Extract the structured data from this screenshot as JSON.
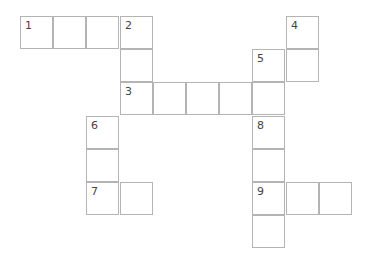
{
  "puzzle": {
    "type": "crossword",
    "origin": {
      "x": 20,
      "y": 16
    },
    "cell_size": 33.2,
    "cells": [
      {
        "row": 0,
        "col": 0,
        "number": "1"
      },
      {
        "row": 0,
        "col": 1,
        "number": ""
      },
      {
        "row": 0,
        "col": 2,
        "number": ""
      },
      {
        "row": 0,
        "col": 3,
        "number": "2"
      },
      {
        "row": 0,
        "col": 8,
        "number": "4"
      },
      {
        "row": 1,
        "col": 3,
        "number": ""
      },
      {
        "row": 1,
        "col": 7,
        "number": "5"
      },
      {
        "row": 1,
        "col": 8,
        "number": ""
      },
      {
        "row": 2,
        "col": 3,
        "number": "3"
      },
      {
        "row": 2,
        "col": 4,
        "number": ""
      },
      {
        "row": 2,
        "col": 5,
        "number": ""
      },
      {
        "row": 2,
        "col": 6,
        "number": ""
      },
      {
        "row": 2,
        "col": 7,
        "number": ""
      },
      {
        "row": 3,
        "col": 2,
        "number": "6"
      },
      {
        "row": 3,
        "col": 7,
        "number": "8"
      },
      {
        "row": 4,
        "col": 2,
        "number": ""
      },
      {
        "row": 4,
        "col": 7,
        "number": ""
      },
      {
        "row": 5,
        "col": 2,
        "number": "7"
      },
      {
        "row": 5,
        "col": 3,
        "number": ""
      },
      {
        "row": 5,
        "col": 7,
        "number": "9"
      },
      {
        "row": 5,
        "col": 8,
        "number": ""
      },
      {
        "row": 5,
        "col": 9,
        "number": ""
      },
      {
        "row": 6,
        "col": 7,
        "number": ""
      }
    ]
  }
}
